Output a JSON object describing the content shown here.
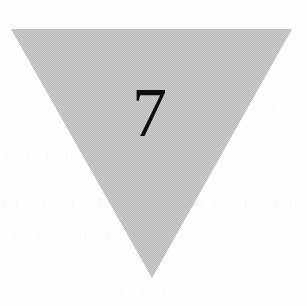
{
  "page": {
    "width": 307,
    "height": 306,
    "background_color": "#fefefe",
    "media": "scanned-paper"
  },
  "figure": {
    "name": "inverted-triangle-with-numeral",
    "shape": "triangle",
    "orientation": "pointing-down",
    "label": "7",
    "fill_style": "halftone-dither-checkerboard",
    "fill_color_light": "#d2d2d2",
    "fill_color_dark": "#b5b5b5",
    "fill_color_average": "#c4c4c4",
    "outline": "none",
    "label_color": "#0d0d0d",
    "vertices": [
      {
        "name": "top-left",
        "x": 11,
        "y": 29
      },
      {
        "name": "top-right",
        "x": 292,
        "y": 29
      },
      {
        "name": "apex",
        "x": 152,
        "y": 278
      }
    ],
    "label_center": {
      "x": 146,
      "y": 120
    }
  },
  "artifacts": {
    "description": "faint bleed-through ghost text from reverse of scanned page",
    "marks": [
      "| | |  | |",
      "|| | |  ||",
      "| |  |  | |",
      "|  ||  |",
      "||  |  ||",
      "|  |  |"
    ]
  }
}
